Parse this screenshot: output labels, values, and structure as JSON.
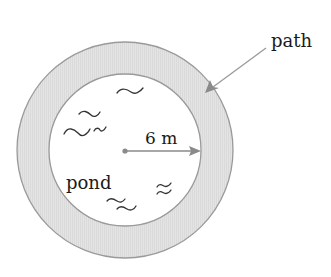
{
  "diagram": {
    "labels": {
      "path": "path",
      "radius": "6 m",
      "pond": "pond"
    },
    "geometry": {
      "center": [
        125,
        150
      ],
      "inner_radius": 76,
      "outer_radius": 108
    },
    "colors": {
      "ring_fill": "#e2e2e2",
      "ring_stroke": "#9a9a9a",
      "arrow": "#8a8a8a",
      "center_dot": "#8a8a8a",
      "text": "#1a1a1a",
      "wave": "#333333"
    }
  }
}
